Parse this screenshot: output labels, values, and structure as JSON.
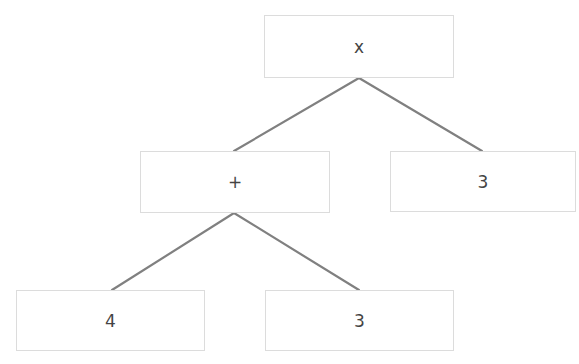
{
  "diagram": {
    "type": "expression-tree",
    "nodes": [
      {
        "id": "root",
        "label": "x",
        "role": "operator (multiply)"
      },
      {
        "id": "plus",
        "label": "+",
        "role": "operator (add)"
      },
      {
        "id": "right3",
        "label": "3",
        "role": "operand"
      },
      {
        "id": "leaf4",
        "label": "4",
        "role": "operand"
      },
      {
        "id": "leaf3",
        "label": "3",
        "role": "operand"
      }
    ],
    "edges": [
      {
        "from": "root",
        "to": "plus"
      },
      {
        "from": "root",
        "to": "right3"
      },
      {
        "from": "plus",
        "to": "leaf4"
      },
      {
        "from": "plus",
        "to": "leaf3"
      }
    ],
    "colors": {
      "edge": "#808080",
      "node_border": "#dcdcdc",
      "text": "#444444",
      "background": "#ffffff"
    }
  }
}
